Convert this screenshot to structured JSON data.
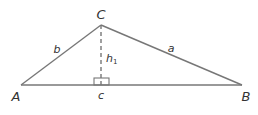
{
  "diagram": {
    "type": "triangle-with-altitude",
    "line_color": "#777777",
    "text_color": "#333333",
    "vertices": {
      "A": {
        "label": "A",
        "x": 21,
        "y": 85
      },
      "B": {
        "label": "B",
        "x": 242,
        "y": 85
      },
      "C": {
        "label": "C",
        "x": 101,
        "y": 25
      }
    },
    "sides": {
      "a": {
        "label": "a",
        "from": "C",
        "to": "B"
      },
      "b": {
        "label": "b",
        "from": "A",
        "to": "C"
      },
      "c": {
        "label": "c",
        "from": "A",
        "to": "B"
      }
    },
    "altitude": {
      "label_main": "h",
      "label_sub": "1",
      "from": "C",
      "foot": {
        "x": 101,
        "y": 85
      },
      "style": "dashed",
      "right_angle_marker": true
    }
  }
}
